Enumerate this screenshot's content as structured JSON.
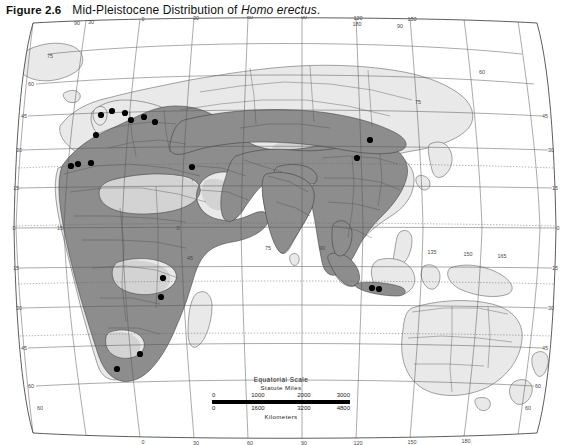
{
  "caption": {
    "figure_number": "Figure 2.6",
    "title_prefix": "Mid-Pleistocene Distribution of ",
    "title_italic": "Homo erectus",
    "title_suffix": "."
  },
  "map": {
    "projection_note": "world-oval",
    "colors": {
      "distribution_fill": "#8d8d8d",
      "land_fill": "#e9e9e9",
      "desert_fill": "#d0d0d0",
      "ocean_fill": "#ffffff",
      "coastline": "#4d4d4d",
      "graticule": "#5a5a5a",
      "border": "#3a3a3a",
      "site_dot": "#000000"
    },
    "graticule": {
      "top_labels": [
        "90",
        "30",
        "0",
        "30",
        "60",
        "90",
        "120",
        "150",
        "180",
        "90"
      ],
      "bottom_labels": [
        "60",
        "0",
        "30",
        "60",
        "60",
        "90",
        "120",
        "150",
        "180",
        "60"
      ],
      "left_labels": [
        "60",
        "45",
        "30",
        "15",
        "0",
        "15",
        "30",
        "45",
        "60"
      ],
      "right_labels": [
        "45",
        "30",
        "15",
        "0",
        "15",
        "30",
        "45",
        "60"
      ],
      "interior_labels": [
        "75",
        "75",
        "60",
        "60",
        "45",
        "45",
        "30",
        "15",
        "0",
        "15",
        "165",
        "180",
        "15",
        "30",
        "45",
        "60",
        "75",
        "90",
        "105",
        "120",
        "135",
        "150"
      ]
    },
    "sites": [
      {
        "name": "site-britain",
        "x": 101,
        "y": 99
      },
      {
        "name": "site-north-europe-a",
        "x": 112,
        "y": 95
      },
      {
        "name": "site-north-europe-b",
        "x": 125,
        "y": 97
      },
      {
        "name": "site-central-europe-a",
        "x": 131,
        "y": 104
      },
      {
        "name": "site-central-europe-b",
        "x": 144,
        "y": 101
      },
      {
        "name": "site-central-europe-c",
        "x": 155,
        "y": 106
      },
      {
        "name": "site-iberia",
        "x": 96,
        "y": 119
      },
      {
        "name": "site-northwest-africa-a",
        "x": 71,
        "y": 150
      },
      {
        "name": "site-northwest-africa-b",
        "x": 78,
        "y": 148
      },
      {
        "name": "site-northwest-africa-c",
        "x": 91,
        "y": 147
      },
      {
        "name": "site-levant",
        "x": 192,
        "y": 151
      },
      {
        "name": "site-east-africa-a",
        "x": 163,
        "y": 262
      },
      {
        "name": "site-east-africa-b",
        "x": 161,
        "y": 281
      },
      {
        "name": "site-south-africa-a",
        "x": 140,
        "y": 338
      },
      {
        "name": "site-south-africa-b",
        "x": 117,
        "y": 353
      },
      {
        "name": "site-china-a",
        "x": 370,
        "y": 124
      },
      {
        "name": "site-china-b",
        "x": 357,
        "y": 142
      },
      {
        "name": "site-java-a",
        "x": 372,
        "y": 272
      },
      {
        "name": "site-java-b",
        "x": 379,
        "y": 273
      }
    ]
  },
  "scalebar": {
    "title": "Equatorial Scale",
    "subtitle": "Statute Miles",
    "miles": [
      "0",
      "1000",
      "2000",
      "3000"
    ],
    "kilometers": [
      "0",
      "1600",
      "3200",
      "4800"
    ],
    "footer": "Kilometers"
  }
}
